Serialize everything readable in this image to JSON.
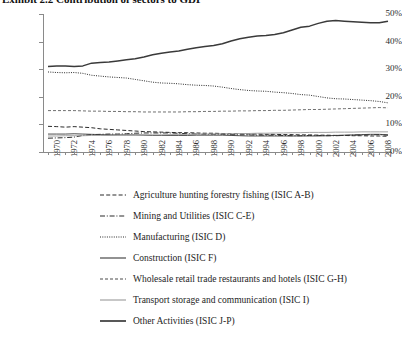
{
  "title": {
    "text": "Exhibit 2.2  Contribution of sectors to GDP",
    "truncated": true
  },
  "chart_data": {
    "type": "line",
    "title": "Exhibit 2.2  Contribution of sectors to GDP",
    "xlabel": "",
    "ylabel": "",
    "ylim": [
      0,
      50
    ],
    "yticks": [
      "0%",
      "10%",
      "20%",
      "30%",
      "40%",
      "50%"
    ],
    "ytick_values": [
      0,
      10,
      20,
      30,
      40,
      50
    ],
    "grid": false,
    "legend_position": "below",
    "xlim": [
      1970,
      2009
    ],
    "x": [
      1970,
      1971,
      1972,
      1973,
      1974,
      1975,
      1976,
      1977,
      1978,
      1979,
      1980,
      1981,
      1982,
      1983,
      1984,
      1985,
      1986,
      1987,
      1988,
      1989,
      1990,
      1991,
      1992,
      1993,
      1994,
      1995,
      1996,
      1997,
      1998,
      1999,
      2000,
      2001,
      2002,
      2003,
      2004,
      2005,
      2006,
      2007,
      2008,
      2009
    ],
    "xtick_labels": [
      "1970",
      "1972",
      "1974",
      "1976",
      "1978",
      "1980",
      "1982",
      "1984",
      "1986",
      "1988",
      "1990",
      "1992",
      "1994",
      "1996",
      "1998",
      "2000",
      "2002",
      "2004",
      "2006",
      "2008"
    ],
    "series": [
      {
        "name": "Agriculture hunting forestry fishing (ISIC A-B)",
        "style": "dashed",
        "color": "#2b2b2b",
        "values": [
          9.3,
          9.2,
          9.0,
          9.2,
          9.0,
          8.8,
          8.4,
          8.2,
          8.0,
          7.8,
          7.6,
          7.4,
          7.3,
          7.2,
          7.1,
          7.0,
          7.0,
          6.9,
          6.8,
          6.8,
          6.7,
          6.6,
          6.6,
          6.5,
          6.5,
          6.4,
          6.4,
          6.3,
          6.3,
          6.2,
          6.2,
          6.1,
          6.1,
          6.0,
          6.0,
          5.9,
          5.9,
          5.8,
          5.8,
          5.7
        ]
      },
      {
        "name": "Mining and Utilities (ISIC C-E)",
        "style": "dash-dot",
        "color": "#2b2b2b",
        "values": [
          5.0,
          5.1,
          5.2,
          5.4,
          6.0,
          6.3,
          6.4,
          6.5,
          6.5,
          6.6,
          6.8,
          6.9,
          6.9,
          6.9,
          6.9,
          6.8,
          6.6,
          6.5,
          6.4,
          6.4,
          6.4,
          6.3,
          6.2,
          6.2,
          6.1,
          6.1,
          6.1,
          6.0,
          5.9,
          5.9,
          6.0,
          6.0,
          5.9,
          5.9,
          6.0,
          6.1,
          6.2,
          6.2,
          6.3,
          6.1
        ]
      },
      {
        "name": "Manufacturing (ISIC D)",
        "style": "dotted",
        "color": "#2b2b2b",
        "values": [
          29.0,
          28.8,
          28.7,
          28.8,
          28.5,
          27.8,
          27.5,
          27.2,
          27.0,
          26.8,
          26.3,
          25.8,
          25.3,
          25.0,
          24.9,
          24.7,
          24.4,
          24.2,
          24.1,
          23.9,
          23.5,
          23.0,
          22.6,
          22.3,
          22.1,
          22.0,
          21.7,
          21.5,
          21.2,
          20.8,
          20.6,
          20.1,
          19.6,
          19.3,
          19.2,
          19.0,
          18.8,
          18.6,
          18.3,
          17.8
        ]
      },
      {
        "name": "Construction (ISIC F)",
        "style": "solid",
        "color": "#3a3a3a",
        "values": [
          6.5,
          6.5,
          6.5,
          6.6,
          6.5,
          6.4,
          6.3,
          6.2,
          6.2,
          6.2,
          6.2,
          6.1,
          6.0,
          6.0,
          6.0,
          6.0,
          6.0,
          6.1,
          6.1,
          6.1,
          6.1,
          6.0,
          5.9,
          5.8,
          5.8,
          5.8,
          5.8,
          5.8,
          5.8,
          5.8,
          5.8,
          5.8,
          5.9,
          6.0,
          6.1,
          6.2,
          6.3,
          6.4,
          6.4,
          6.2
        ]
      },
      {
        "name": "Wholesale retail trade restaurants and hotels (ISIC G-H)",
        "style": "fine-dashed",
        "color": "#4a4a4a",
        "values": [
          15.0,
          15.0,
          15.0,
          15.0,
          14.9,
          14.8,
          14.8,
          14.7,
          14.7,
          14.6,
          14.6,
          14.5,
          14.5,
          14.5,
          14.5,
          14.5,
          14.6,
          14.6,
          14.7,
          14.7,
          14.8,
          14.8,
          14.9,
          14.9,
          15.0,
          15.0,
          15.1,
          15.1,
          15.2,
          15.3,
          15.4,
          15.4,
          15.5,
          15.6,
          15.7,
          15.8,
          15.9,
          16.0,
          16.1,
          16.0
        ]
      },
      {
        "name": "Transport storage and communication (ISIC I)",
        "style": "light-solid",
        "color": "#9a9a9a",
        "values": [
          5.8,
          5.8,
          5.9,
          5.9,
          5.9,
          6.0,
          6.0,
          6.0,
          6.1,
          6.1,
          6.1,
          6.2,
          6.2,
          6.2,
          6.3,
          6.3,
          6.4,
          6.4,
          6.5,
          6.5,
          6.6,
          6.6,
          6.7,
          6.7,
          6.8,
          6.8,
          6.9,
          6.9,
          7.0,
          7.0,
          7.1,
          7.1,
          7.1,
          7.2,
          7.2,
          7.2,
          7.3,
          7.3,
          7.3,
          7.3
        ]
      },
      {
        "name": "Other Activities (ISIC J-P)",
        "style": "bold-solid",
        "color": "#3a3a3a",
        "values": [
          31.0,
          31.2,
          31.2,
          31.0,
          31.2,
          32.2,
          32.4,
          32.6,
          33.0,
          33.4,
          33.8,
          34.4,
          35.2,
          35.8,
          36.2,
          36.6,
          37.2,
          37.8,
          38.2,
          38.6,
          39.2,
          40.2,
          41.0,
          41.6,
          42.0,
          42.2,
          42.6,
          43.2,
          44.2,
          45.2,
          45.6,
          46.6,
          47.4,
          47.6,
          47.4,
          47.2,
          47.0,
          46.8,
          46.8,
          47.4
        ]
      }
    ]
  },
  "legend": {
    "items": [
      {
        "label": "Agriculture hunting forestry fishing (ISIC A-B)",
        "style": "dashed"
      },
      {
        "label": "Mining and Utilities (ISIC C-E)",
        "style": "dash-dot"
      },
      {
        "label": "Manufacturing (ISIC D)",
        "style": "dotted"
      },
      {
        "label": "Construction (ISIC F)",
        "style": "solid"
      },
      {
        "label": "Wholesale retail trade restaurants and hotels (ISIC G-H)",
        "style": "fine-dashed"
      },
      {
        "label": "Transport storage and communication (ISIC I)",
        "style": "light-solid"
      },
      {
        "label": "Other Activities (ISIC J-P)",
        "style": "bold-solid"
      }
    ]
  }
}
